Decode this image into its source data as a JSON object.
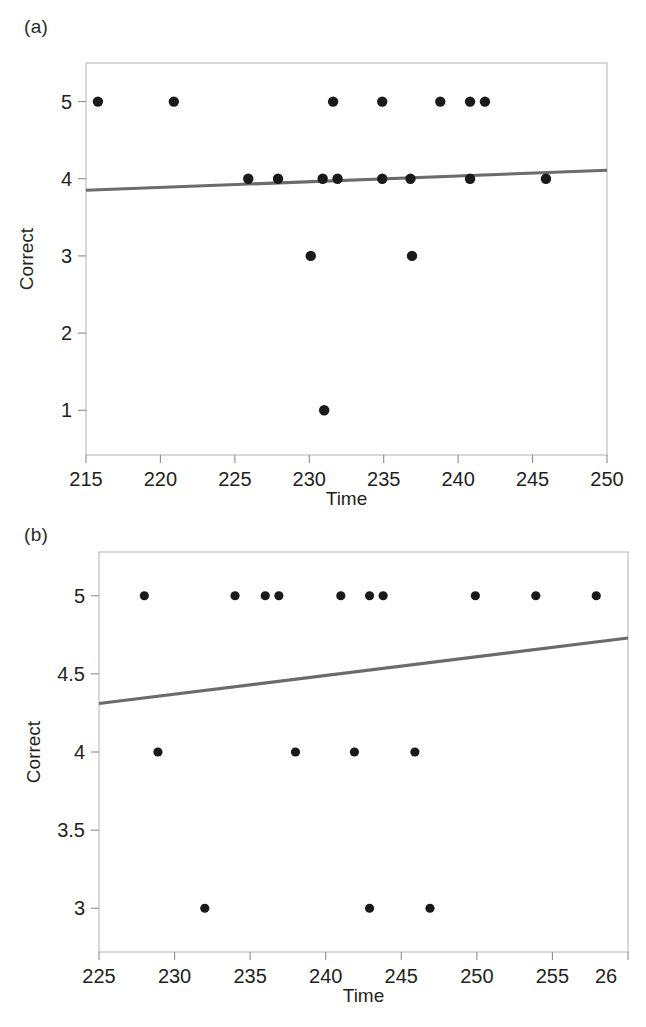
{
  "figure": {
    "panel_a_label": "(a)",
    "panel_b_label": "(b)"
  },
  "chart_data": [
    {
      "id": "panel-a",
      "type": "scatter",
      "title": "",
      "xlabel": "Time",
      "ylabel": "Correct",
      "xlim": [
        215,
        250
      ],
      "ylim": [
        0.42,
        5.5
      ],
      "xticks": [
        215,
        220,
        225,
        230,
        235,
        240,
        245,
        250
      ],
      "xticklabels": [
        "215",
        "220",
        "225",
        "230",
        "235",
        "240",
        "245",
        "250"
      ],
      "yticks": [
        1,
        2,
        3,
        4,
        5
      ],
      "yticklabels": [
        "1",
        "2",
        "3",
        "4",
        "5"
      ],
      "grid": false,
      "legend": "none",
      "points": [
        {
          "x": 215.8,
          "y": 5
        },
        {
          "x": 220.9,
          "y": 5
        },
        {
          "x": 231.6,
          "y": 5
        },
        {
          "x": 234.9,
          "y": 5
        },
        {
          "x": 238.8,
          "y": 5
        },
        {
          "x": 240.8,
          "y": 5
        },
        {
          "x": 241.8,
          "y": 5
        },
        {
          "x": 225.9,
          "y": 4
        },
        {
          "x": 227.9,
          "y": 4
        },
        {
          "x": 230.9,
          "y": 4
        },
        {
          "x": 231.9,
          "y": 4
        },
        {
          "x": 234.9,
          "y": 4
        },
        {
          "x": 236.8,
          "y": 4
        },
        {
          "x": 240.8,
          "y": 4
        },
        {
          "x": 245.9,
          "y": 4
        },
        {
          "x": 230.1,
          "y": 3
        },
        {
          "x": 236.9,
          "y": 3
        },
        {
          "x": 231.0,
          "y": 1
        }
      ],
      "fit_line": {
        "name": "linear fit",
        "x": [
          215,
          250
        ],
        "y": [
          3.85,
          4.11
        ],
        "color": "#6b6b6b"
      }
    },
    {
      "id": "panel-b",
      "type": "scatter",
      "title": "",
      "xlabel": "Time",
      "ylabel": "Correct",
      "xlim": [
        225,
        260
      ],
      "ylim": [
        2.72,
        5.28
      ],
      "xticks": [
        225,
        230,
        235,
        240,
        245,
        250,
        255,
        260
      ],
      "xticklabels": [
        "225",
        "230",
        "235",
        "240",
        "245",
        "250",
        "255",
        "26"
      ],
      "yticks": [
        3,
        3.5,
        4,
        4.5,
        5
      ],
      "yticklabels": [
        "3",
        "3.5",
        "4",
        "4.5",
        "5"
      ],
      "grid": false,
      "legend": "none",
      "points": [
        {
          "x": 228.0,
          "y": 5
        },
        {
          "x": 234.0,
          "y": 5
        },
        {
          "x": 236.0,
          "y": 5
        },
        {
          "x": 236.9,
          "y": 5
        },
        {
          "x": 241.0,
          "y": 5
        },
        {
          "x": 242.9,
          "y": 5
        },
        {
          "x": 243.8,
          "y": 5
        },
        {
          "x": 249.9,
          "y": 5
        },
        {
          "x": 253.9,
          "y": 5
        },
        {
          "x": 257.9,
          "y": 5
        },
        {
          "x": 228.9,
          "y": 4
        },
        {
          "x": 238.0,
          "y": 4
        },
        {
          "x": 241.9,
          "y": 4
        },
        {
          "x": 245.9,
          "y": 4
        },
        {
          "x": 232.0,
          "y": 3
        },
        {
          "x": 242.9,
          "y": 3
        },
        {
          "x": 246.9,
          "y": 3
        }
      ],
      "fit_line": {
        "name": "linear fit",
        "x": [
          225,
          260
        ],
        "y": [
          4.31,
          4.73
        ],
        "color": "#6b6b6b"
      }
    }
  ]
}
